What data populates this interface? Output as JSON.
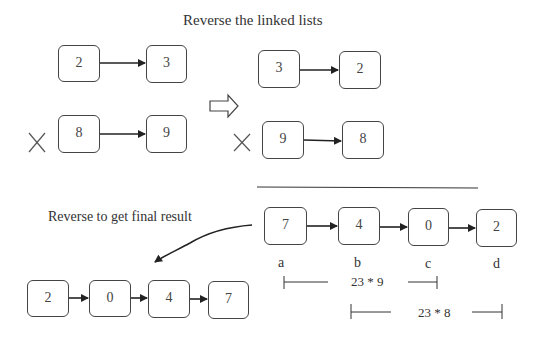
{
  "title": "Reverse the linked lists",
  "left_caption": "Reverse to get final result",
  "input_lists": [
    {
      "nodes": [
        "2",
        "3"
      ],
      "crossed": false
    },
    {
      "nodes": [
        "8",
        "9"
      ],
      "crossed": true
    }
  ],
  "reversed_lists": [
    {
      "nodes": [
        "3",
        "2"
      ],
      "crossed": false
    },
    {
      "nodes": [
        "9",
        "8"
      ],
      "crossed": true
    }
  ],
  "product_list": {
    "nodes": [
      "7",
      "4",
      "0",
      "2"
    ],
    "labels": [
      "a",
      "b",
      "c",
      "d"
    ]
  },
  "spans": [
    {
      "label": "23 * 9",
      "from": "a",
      "to": "c"
    },
    {
      "label": "23 * 8",
      "from": "b",
      "to": "d"
    }
  ],
  "final_result": {
    "nodes": [
      "2",
      "0",
      "4",
      "7"
    ]
  },
  "icons": {
    "cross": "x-mark-icon",
    "transform_arrow": "hollow-right-arrow-icon",
    "link_arrow": "arrow-right-icon",
    "curved_arrow": "curved-arrow-icon"
  }
}
